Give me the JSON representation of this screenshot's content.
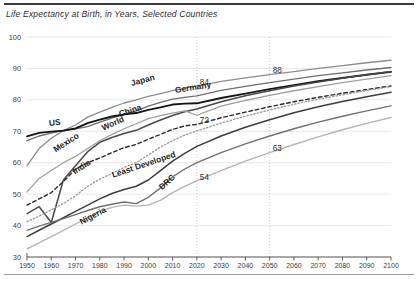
{
  "chart_data": {
    "type": "line",
    "title": "Life Expectancy at Birth, in Years, Selected Countries",
    "xlabel": "",
    "ylabel": "",
    "xlim": [
      1950,
      2100
    ],
    "ylim": [
      30,
      100
    ],
    "ytick_values": [
      30,
      40,
      50,
      60,
      70,
      80,
      90,
      100
    ],
    "ytick_labels": [
      "30",
      "40",
      "50",
      "60",
      "70",
      "80",
      "90",
      "100"
    ],
    "xtick_values": [
      1950,
      1960,
      1970,
      1980,
      1990,
      2000,
      2010,
      2020,
      2030,
      2040,
      2050,
      2060,
      2070,
      2080,
      2090,
      2100
    ],
    "xtick_labels": [
      "1950",
      "1960",
      "1970",
      "1980",
      "1990",
      "2000",
      "2010",
      "2020",
      "2030",
      "2040",
      "2050",
      "2060",
      "2070",
      "2080",
      "2090",
      "2100"
    ],
    "grid": "horizontal gridlines light; vertical dotted gridlines at 2020 and 2050",
    "legend": "inline series labels on curves",
    "vertical_markers": [
      2020,
      2050
    ],
    "annotations": [
      {
        "text": "84",
        "x": 2020,
        "y": 84
      },
      {
        "text": "88",
        "x": 2050,
        "y": 88
      },
      {
        "text": "72",
        "x": 2020,
        "y": 72
      },
      {
        "text": "63",
        "x": 2050,
        "y": 63
      },
      {
        "text": "54",
        "x": 2020,
        "y": 54
      }
    ],
    "x": [
      1950,
      1955,
      1960,
      1965,
      1970,
      1975,
      1980,
      1985,
      1990,
      1995,
      2000,
      2005,
      2010,
      2015,
      2020,
      2030,
      2040,
      2050,
      2060,
      2070,
      2080,
      2090,
      2100
    ],
    "series": [
      {
        "name": "Japan",
        "style": "solid",
        "color": "#8c8c8c",
        "width": 1.3,
        "label_x": 1993,
        "label_y": 85.5,
        "values": [
          59.1,
          64.5,
          67.8,
          70.2,
          72.0,
          74.5,
          76.1,
          77.6,
          79.0,
          80.0,
          81.1,
          82.0,
          82.9,
          83.8,
          84.4,
          85.9,
          87.0,
          88.0,
          89.0,
          90.0,
          90.9,
          91.8,
          92.6
        ]
      },
      {
        "name": "Germany",
        "style": "solid",
        "color": "#6e6e6e",
        "width": 1.3,
        "label_x": 2011,
        "label_y": 83.0,
        "values": [
          67.0,
          68.5,
          69.4,
          70.3,
          70.8,
          71.5,
          72.9,
          74.2,
          75.4,
          76.5,
          78.0,
          79.2,
          80.2,
          80.8,
          81.3,
          83.0,
          84.3,
          85.5,
          86.6,
          87.7,
          88.6,
          89.5,
          90.3
        ]
      },
      {
        "name": "US",
        "style": "solid",
        "color": "#151515",
        "width": 1.9,
        "label_x": 1959,
        "label_y": 72.5,
        "values": [
          68.4,
          69.5,
          69.9,
          70.2,
          70.9,
          72.6,
          73.7,
          74.7,
          75.4,
          75.8,
          76.8,
          77.6,
          78.5,
          78.8,
          78.9,
          80.6,
          82.0,
          83.4,
          84.7,
          85.9,
          87.0,
          88.0,
          88.9
        ]
      },
      {
        "name": "China",
        "style": "solid",
        "color": "#4a4a4a",
        "width": 1.5,
        "label_x": 1988,
        "label_y": 75.5,
        "values": [
          43.8,
          46.0,
          41.0,
          54.5,
          59.0,
          63.5,
          66.5,
          68.0,
          69.3,
          70.3,
          72.0,
          73.6,
          75.0,
          76.2,
          77.1,
          79.4,
          81.3,
          82.9,
          84.4,
          85.7,
          86.9,
          88.0,
          89.0
        ]
      },
      {
        "name": "Mexico",
        "style": "solid",
        "color": "#9e9e9e",
        "width": 1.3,
        "label_x": 1961,
        "label_y": 64.0,
        "values": [
          50.7,
          55.0,
          57.5,
          60.0,
          62.0,
          64.5,
          67.0,
          69.0,
          70.8,
          72.4,
          74.0,
          75.0,
          75.8,
          76.5,
          75.1,
          78.0,
          79.8,
          81.4,
          82.9,
          84.2,
          85.5,
          86.6,
          87.7
        ]
      },
      {
        "name": "World",
        "style": "dashed",
        "color": "#2b2b2b",
        "width": 1.4,
        "label_x": 1981,
        "label_y": 71.0,
        "values": [
          46.5,
          48.5,
          50.5,
          54.0,
          58.0,
          60.0,
          61.5,
          63.2,
          64.8,
          65.8,
          67.5,
          69.0,
          70.6,
          71.7,
          72.2,
          74.3,
          76.1,
          77.8,
          79.4,
          80.8,
          82.1,
          83.3,
          84.4
        ]
      },
      {
        "name": "India",
        "style": "dotted",
        "color": "#9a9a9a",
        "width": 1.3,
        "label_x": 1969,
        "label_y": 57.0,
        "values": [
          41.2,
          43.0,
          45.0,
          47.0,
          49.5,
          52.5,
          54.8,
          56.5,
          58.5,
          60.0,
          62.5,
          65.0,
          67.0,
          68.8,
          70.1,
          72.6,
          74.8,
          76.8,
          78.6,
          80.2,
          81.6,
          83.0,
          84.2
        ]
      },
      {
        "name": "Least Developed",
        "style": "solid",
        "color": "#3d3d3d",
        "width": 1.5,
        "label_x": 1985,
        "label_y": 56.0,
        "values": [
          36.5,
          38.5,
          40.5,
          42.5,
          44.5,
          46.5,
          48.5,
          50.2,
          51.5,
          52.5,
          54.5,
          57.5,
          60.5,
          63.0,
          65.2,
          68.5,
          71.3,
          73.7,
          75.9,
          77.8,
          79.5,
          81.0,
          82.4
        ]
      },
      {
        "name": "DRC",
        "style": "solid",
        "color": "#707070",
        "width": 1.4,
        "label_x": 2005,
        "label_y": 52.0,
        "values": [
          38.5,
          39.8,
          41.0,
          42.2,
          43.5,
          44.8,
          46.0,
          46.8,
          47.5,
          47.0,
          49.0,
          52.0,
          55.5,
          58.0,
          60.0,
          63.2,
          66.0,
          68.5,
          70.8,
          72.9,
          74.8,
          76.5,
          78.1
        ]
      },
      {
        "name": "Nigeria",
        "style": "solid",
        "color": "#b4b4b4",
        "width": 1.4,
        "label_x": 1972,
        "label_y": 41.0,
        "values": [
          32.6,
          34.5,
          36.5,
          38.5,
          40.5,
          42.5,
          44.5,
          45.8,
          46.5,
          46.2,
          46.5,
          48.0,
          50.5,
          52.5,
          54.3,
          57.5,
          60.5,
          63.2,
          65.8,
          68.2,
          70.5,
          72.5,
          74.4
        ]
      }
    ]
  }
}
